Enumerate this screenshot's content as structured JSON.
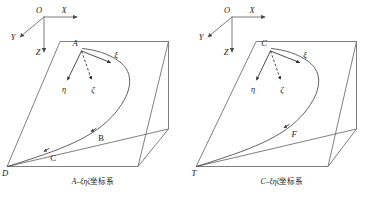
{
  "figure": {
    "title": "",
    "background_color": "#ffffff",
    "line_color": "#6f6f6f",
    "text_color": "#1a1a1a",
    "panels": [
      {
        "id": "left",
        "caption_prefix": "A",
        "caption_dash": "–",
        "caption_greek": "ξηζ",
        "caption_suffix": "坐标系",
        "caption_full": "A–ξηζ坐标系",
        "global_axes": {
          "origin_label": "O",
          "x_label": "X",
          "y_label": "Y",
          "z_label": "Z"
        },
        "apex_label": "A",
        "local_axes": [
          {
            "name": "xi",
            "label": "ξ"
          },
          {
            "name": "eta",
            "label": "η"
          },
          {
            "name": "zeta",
            "label": "ζ"
          }
        ],
        "path_points": [
          {
            "label": "B"
          },
          {
            "label": "C"
          }
        ],
        "corner_label": "D"
      },
      {
        "id": "right",
        "caption_prefix": "C",
        "caption_dash": "–",
        "caption_greek": "ξηζ",
        "caption_suffix": "坐标系",
        "caption_full": "C–ξηζ坐标系",
        "global_axes": {
          "origin_label": "O",
          "x_label": "X",
          "y_label": "Y",
          "z_label": "Z"
        },
        "apex_label": "C",
        "local_axes": [
          {
            "name": "xi",
            "label": "ξ"
          },
          {
            "name": "eta",
            "label": "η"
          },
          {
            "name": "zeta",
            "label": "ζ"
          }
        ],
        "path_points": [
          {
            "label": "F"
          }
        ],
        "corner_label": "T"
      }
    ]
  }
}
